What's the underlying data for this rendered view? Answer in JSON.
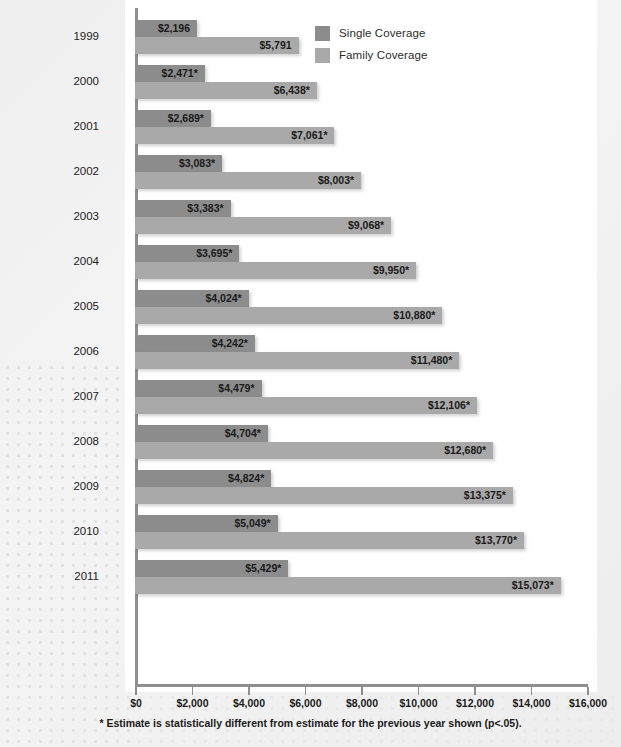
{
  "legend": {
    "position": "top-right",
    "items": [
      {
        "label": "Single Coverage",
        "color": "#8c8c8c"
      },
      {
        "label": "Family Coverage",
        "color": "#a9a9a9"
      }
    ]
  },
  "footnote": "* Estimate is statistically different from estimate for the previous year shown (p<.05).",
  "chart_data": {
    "type": "bar",
    "orientation": "horizontal",
    "title": "",
    "xlabel": "",
    "ylabel": "",
    "xlim": [
      0,
      16000
    ],
    "grid": false,
    "legend_position": "top-right",
    "categories": [
      "1999",
      "2000",
      "2001",
      "2002",
      "2003",
      "2004",
      "2005",
      "2006",
      "2007",
      "2008",
      "2009",
      "2010",
      "2011"
    ],
    "xticks": [
      0,
      2000,
      4000,
      6000,
      8000,
      10000,
      12000,
      14000,
      16000
    ],
    "xtick_labels": [
      "$0",
      "$2,000",
      "$4,000",
      "$6,000",
      "$8,000",
      "$10,000",
      "$12,000",
      "$14,000",
      "$16,000"
    ],
    "series": [
      {
        "name": "Single Coverage",
        "color": "#8c8c8c",
        "values": [
          2196,
          2471,
          2689,
          3083,
          3383,
          3695,
          4024,
          4242,
          4479,
          4704,
          4824,
          5049,
          5429
        ],
        "labels": [
          "$2,196",
          "$2,471*",
          "$2,689*",
          "$3,083*",
          "$3,383*",
          "$3,695*",
          "$4,024*",
          "$4,242*",
          "$4,479*",
          "$4,704*",
          "$4,824*",
          "$5,049*",
          "$5,429*"
        ]
      },
      {
        "name": "Family Coverage",
        "color": "#a9a9a9",
        "values": [
          5791,
          6438,
          7061,
          8003,
          9068,
          9950,
          10880,
          11480,
          12106,
          12680,
          13375,
          13770,
          15073
        ],
        "labels": [
          "$5,791",
          "$6,438*",
          "$7,061*",
          "$8,003*",
          "$9,068*",
          "$9,950*",
          "$10,880*",
          "$11,480*",
          "$12,106*",
          "$12,680*",
          "$13,375*",
          "$13,770*",
          "$15,073*"
        ]
      }
    ]
  }
}
